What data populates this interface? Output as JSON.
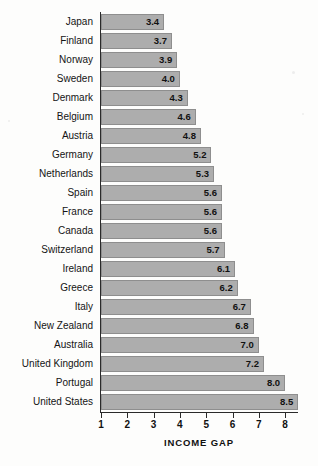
{
  "chart_data": {
    "type": "bar",
    "orientation": "horizontal",
    "title": "",
    "xlabel": "INCOME GAP",
    "ylabel": "",
    "xlim": [
      1,
      8.9
    ],
    "xticks": [
      1,
      2,
      3,
      4,
      5,
      6,
      7,
      8
    ],
    "xtick_labels": [
      "1",
      "2",
      "3",
      "4",
      "5",
      "6",
      "7",
      "8"
    ],
    "grid": false,
    "legend": null,
    "bar_color": "#adadad",
    "bar_edge_color": "#8e8e8e",
    "axis_color": "#2a2a2a",
    "value_labels_inside": true,
    "categories": [
      "Japan",
      "Finland",
      "Norway",
      "Sweden",
      "Denmark",
      "Belgium",
      "Austria",
      "Germany",
      "Netherlands",
      "Spain",
      "France",
      "Canada",
      "Switzerland",
      "Ireland",
      "Greece",
      "Italy",
      "New Zealand",
      "Australia",
      "United Kingdom",
      "Portugal",
      "United States"
    ],
    "values": [
      3.4,
      3.7,
      3.9,
      4.0,
      4.3,
      4.6,
      4.8,
      5.2,
      5.3,
      5.6,
      5.6,
      5.6,
      5.7,
      6.1,
      6.2,
      6.7,
      6.8,
      7.0,
      7.2,
      8.0,
      8.5
    ],
    "value_labels": [
      "3.4",
      "3.7",
      "3.9",
      "4.0",
      "4.3",
      "4.6",
      "4.8",
      "5.2",
      "5.3",
      "5.6",
      "5.6",
      "5.6",
      "5.7",
      "6.1",
      "6.2",
      "6.7",
      "6.8",
      "7.0",
      "7.2",
      "8.0",
      "8.5"
    ]
  }
}
